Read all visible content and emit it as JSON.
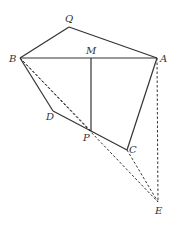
{
  "diagram": {
    "points": {
      "Q": {
        "label": "Q",
        "x": 69,
        "y": 27,
        "lx": 65,
        "ly": 22
      },
      "B": {
        "label": "B",
        "x": 20,
        "y": 58,
        "lx": 9,
        "ly": 62
      },
      "M": {
        "label": "M",
        "x": 91,
        "y": 58,
        "lx": 86,
        "ly": 54
      },
      "A": {
        "label": "A",
        "x": 157,
        "y": 58,
        "lx": 160,
        "ly": 62
      },
      "D": {
        "label": "D",
        "x": 53,
        "y": 111,
        "lx": 46,
        "ly": 120
      },
      "P": {
        "label": "P",
        "x": 91,
        "y": 131,
        "lx": 83,
        "ly": 141
      },
      "C": {
        "label": "C",
        "x": 127,
        "y": 150,
        "lx": 129,
        "ly": 153
      },
      "E": {
        "label": "E",
        "x": 158,
        "y": 202,
        "lx": 155,
        "ly": 214
      }
    },
    "solid_segments": [
      [
        "Q",
        "B"
      ],
      [
        "Q",
        "A"
      ],
      [
        "B",
        "A"
      ],
      [
        "B",
        "D"
      ],
      [
        "D",
        "P"
      ],
      [
        "P",
        "C"
      ],
      [
        "C",
        "A"
      ],
      [
        "M",
        "P"
      ]
    ],
    "dashed_segments": [
      [
        "B",
        "E"
      ],
      [
        "B",
        "P"
      ],
      [
        "C",
        "E"
      ],
      [
        "A",
        "E"
      ]
    ],
    "stroke_color": "#333333"
  }
}
